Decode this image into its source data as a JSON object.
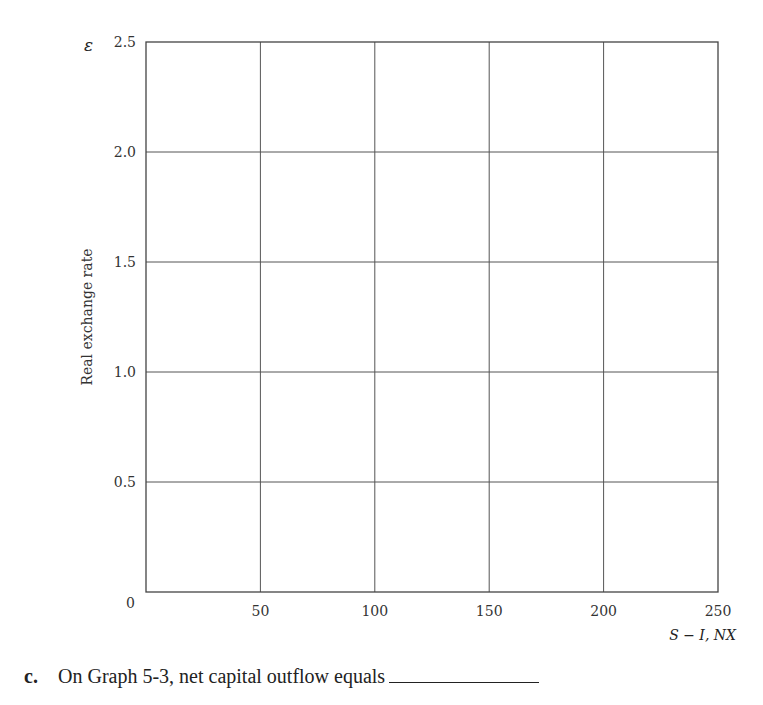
{
  "chart_data": {
    "type": "line",
    "title": "",
    "ylabel": "Real exchange rate",
    "ysymbol": "ε",
    "xlabel": "S − I, NX",
    "xlim": [
      0,
      250
    ],
    "ylim": [
      0,
      2.5
    ],
    "xticks": [
      50,
      100,
      150,
      200,
      250
    ],
    "yticks": [
      0.5,
      1.0,
      1.5,
      2.0,
      2.5
    ],
    "x_tick_labels": [
      "50",
      "100",
      "150",
      "200",
      "250"
    ],
    "y_tick_labels": [
      "0.5",
      "1.0",
      "1.5",
      "2.0",
      "2.5"
    ],
    "origin_label": "0",
    "grid": true,
    "series": []
  },
  "question": {
    "letter": "c.",
    "text": "On Graph 5-3, net capital outflow equals"
  }
}
